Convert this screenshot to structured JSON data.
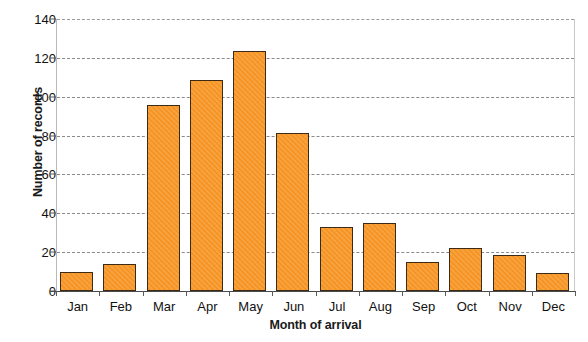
{
  "chart_data": {
    "type": "bar",
    "title": "",
    "xlabel": "Month of arrival",
    "ylabel": "Number of records",
    "categories": [
      "Jan",
      "Feb",
      "Mar",
      "Apr",
      "May",
      "Jun",
      "Jul",
      "Aug",
      "Sep",
      "Oct",
      "Nov",
      "Dec"
    ],
    "values": [
      10,
      14,
      96,
      108.5,
      123.5,
      81.5,
      33,
      35,
      15,
      22,
      18.5,
      9.5
    ],
    "series": [
      {
        "name": "Number of records",
        "values": [
          10,
          14,
          96,
          108.5,
          123.5,
          81.5,
          33,
          35,
          15,
          22,
          18.5,
          9.5
        ]
      }
    ],
    "ylim": [
      0,
      140
    ],
    "yticks": [
      0,
      20,
      40,
      60,
      80,
      100,
      120,
      140
    ],
    "ytick_labels": [
      "0",
      "20",
      "40",
      "60",
      "80",
      "100",
      "120",
      "140"
    ],
    "grid": "horizontal-dashed",
    "legend": "none",
    "bar_color": "#f79421",
    "bar_border_color": "#3d2a14",
    "gridline_color": "#8a8a8a",
    "axis_color": "#4a4a4a",
    "background_color": "#ffffff"
  }
}
